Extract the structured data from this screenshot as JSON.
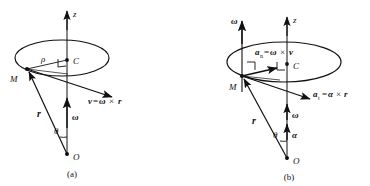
{
  "figure": {
    "type": "physics-vector-diagram",
    "panels": [
      {
        "id": "a",
        "caption": "(a)",
        "axis_label": "z",
        "labels": {
          "center_point": "C",
          "particle_point": "M",
          "origin_point": "O",
          "radius_rho": "ρ",
          "position_vector": "r",
          "angle": "θ",
          "angular_velocity": "ω",
          "velocity_expr_lhs": "v",
          "velocity_expr_eq": "=",
          "velocity_expr_omega": "ω",
          "velocity_expr_cross": "×",
          "velocity_expr_r": "r"
        }
      },
      {
        "id": "b",
        "caption": "(b)",
        "axis_label": "z",
        "labels": {
          "center_point": "C",
          "particle_point": "M",
          "origin_point": "O",
          "position_vector": "r",
          "angle": "θ",
          "angular_velocity_top": "ω",
          "angular_velocity_axis": "ω",
          "angular_acceleration": "α",
          "normal_accel_lhs": "a",
          "normal_accel_sub": "n",
          "normal_accel_eq": "=",
          "normal_accel_omega": "ω",
          "normal_accel_cross": "×",
          "normal_accel_v": "v",
          "tangential_accel_lhs": "a",
          "tangential_accel_sub": "t",
          "tangential_accel_eq": "=",
          "tangential_accel_alpha": "α",
          "tangential_accel_cross": "×",
          "tangential_accel_r": "r"
        }
      }
    ],
    "colors": {
      "ink": "#111111",
      "background": "#ffffff"
    }
  }
}
